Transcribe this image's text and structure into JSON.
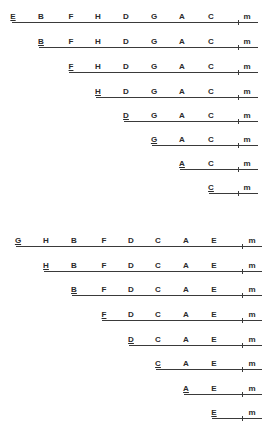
{
  "diagram": {
    "colors": {
      "line": "#3a3a3a",
      "text": "#2a2a2a",
      "background": "#ffffff"
    },
    "groups": [
      {
        "name": "group-1",
        "label_x": {
          "E": 13,
          "B": 41,
          "F": 71,
          "H": 98,
          "D": 126,
          "G": 154,
          "A": 182,
          "C": 211,
          "m": 247
        },
        "tick_x": 238,
        "line_right": 258,
        "rows": [
          {
            "y": 22,
            "line_left": 12,
            "labels": [
              "E",
              "B",
              "F",
              "H",
              "D",
              "G",
              "A",
              "C",
              "m"
            ]
          },
          {
            "y": 47,
            "line_left": 39,
            "labels": [
              "B",
              "F",
              "H",
              "D",
              "G",
              "A",
              "C",
              "m"
            ]
          },
          {
            "y": 72,
            "line_left": 69,
            "labels": [
              "F",
              "H",
              "D",
              "G",
              "A",
              "C",
              "m"
            ]
          },
          {
            "y": 97,
            "line_left": 96,
            "labels": [
              "H",
              "D",
              "G",
              "A",
              "C",
              "m"
            ]
          },
          {
            "y": 121,
            "line_left": 124,
            "labels": [
              "D",
              "G",
              "A",
              "C",
              "m"
            ]
          },
          {
            "y": 145,
            "line_left": 152,
            "labels": [
              "G",
              "A",
              "C",
              "m"
            ]
          },
          {
            "y": 169,
            "line_left": 180,
            "labels": [
              "A",
              "C",
              "m"
            ]
          },
          {
            "y": 193,
            "line_left": 209,
            "labels": [
              "C",
              "m"
            ]
          }
        ]
      },
      {
        "name": "group-2",
        "label_x": {
          "G": 18,
          "H": 46,
          "B": 74,
          "F": 104,
          "D": 131,
          "C": 158,
          "A": 186,
          "E": 214,
          "m": 252
        },
        "tick_x": 242,
        "line_right": 262,
        "rows": [
          {
            "y": 246,
            "line_left": 16,
            "labels": [
              "G",
              "H",
              "B",
              "F",
              "D",
              "C",
              "A",
              "E",
              "m"
            ]
          },
          {
            "y": 271,
            "line_left": 44,
            "labels": [
              "H",
              "B",
              "F",
              "D",
              "C",
              "A",
              "E",
              "m"
            ]
          },
          {
            "y": 295,
            "line_left": 72,
            "labels": [
              "B",
              "F",
              "D",
              "C",
              "A",
              "E",
              "m"
            ]
          },
          {
            "y": 320,
            "line_left": 102,
            "labels": [
              "F",
              "D",
              "C",
              "A",
              "E",
              "m"
            ]
          },
          {
            "y": 345,
            "line_left": 129,
            "labels": [
              "D",
              "C",
              "A",
              "E",
              "m"
            ]
          },
          {
            "y": 369,
            "line_left": 156,
            "labels": [
              "C",
              "A",
              "E",
              "m"
            ]
          },
          {
            "y": 394,
            "line_left": 184,
            "labels": [
              "A",
              "E",
              "m"
            ]
          },
          {
            "y": 418,
            "line_left": 212,
            "labels": [
              "E",
              "m"
            ]
          }
        ]
      }
    ]
  }
}
